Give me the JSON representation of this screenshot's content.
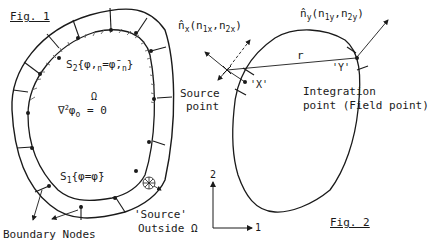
{
  "fig1": {
    "title": "Fig. 1",
    "s2": {
      "symbol": "S",
      "sub": "2",
      "body": "{φ,",
      "n1": "n",
      "eq": "=φ̄,",
      "n2": "n",
      "close": "}"
    },
    "omega": "Ω",
    "laplace": {
      "nabla": "∇",
      "pow": "2",
      "phi": "φ",
      "sub": "o",
      "eq": "= 0"
    },
    "s1": {
      "symbol": "S",
      "sub": "1",
      "body": "{φ=φ̄}"
    },
    "source_outside_line1": "'Source'",
    "source_outside_line2": "Outside Ω",
    "boundary_nodes": "Boundary Nodes"
  },
  "fig2": {
    "title": "Fig. 2",
    "nx": {
      "hat": "n̂",
      "sub": "x",
      "args": "(n",
      "a1": "1x",
      "comma": ",n",
      "a2": "2x",
      "close": ")"
    },
    "ny": {
      "hat": "n̂",
      "sub": "y",
      "args": "(n",
      "a1": "1y",
      "comma": ",n",
      "a2": "2y",
      "close": ")"
    },
    "r": "r",
    "x_label": "'X'",
    "y_label": "'Y'",
    "source_point_line1": "Source",
    "source_point_line2": "point",
    "integration_line1": "Integration",
    "integration_line2": "point (Field point)",
    "axis_1": "1",
    "axis_2": "2"
  },
  "colors": {
    "ink": "#1a1a1a",
    "background": "#ffffff"
  }
}
